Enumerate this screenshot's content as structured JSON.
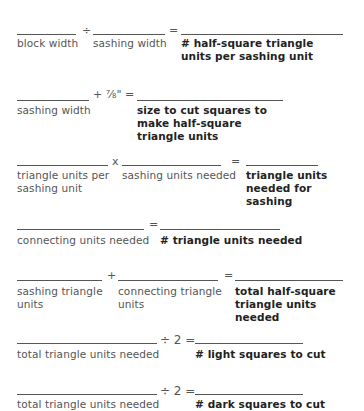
{
  "worksheet": {
    "rows": [
      {
        "operator1": "÷",
        "equals": "=",
        "labels": [
          "block width",
          "sashing width",
          "# half-square triangle units per sashing unit"
        ]
      },
      {
        "operator1": "+ ⅞\" =",
        "labels": [
          "sashing width",
          "size to cut squares to make half-square triangle units"
        ]
      },
      {
        "operator1": "x",
        "equals": "=",
        "labels": [
          "triangle units per sashing unit",
          "sashing units needed",
          "triangle units needed for sashing"
        ]
      },
      {
        "equals": "=",
        "labels": [
          "connecting units needed",
          "# triangle units needed"
        ]
      },
      {
        "operator1": "+",
        "equals": "=",
        "labels": [
          "sashing triangle units",
          "connecting triangle units",
          "total half-square triangle units needed"
        ]
      },
      {
        "operator1": "÷ 2 =",
        "labels": [
          "total triangle units needed",
          "# light squares to cut"
        ]
      },
      {
        "operator1": "÷ 2 =",
        "labels": [
          "total triangle units needed",
          "# dark squares to cut"
        ]
      }
    ]
  }
}
